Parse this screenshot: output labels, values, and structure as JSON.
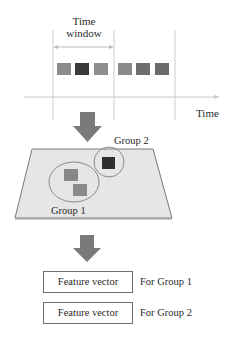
{
  "timeline": {
    "window_label_line1": "Time",
    "window_label_line2": "window",
    "axis_label": "Time",
    "squares": [
      {
        "color": "#8c8c8c"
      },
      {
        "color": "#3a3a3a"
      },
      {
        "color": "#8e8e8e"
      },
      {
        "color": "#8a8a8a"
      },
      {
        "color": "#6e6e6e"
      },
      {
        "color": "#6a6a6a"
      }
    ]
  },
  "grouping": {
    "group1_label": "Group 1",
    "group2_label": "Group 2",
    "plane_color": "#e6e6e6",
    "group1_square_color": "#888888",
    "group2_square_color": "#2e2e2e"
  },
  "features": {
    "rows": [
      {
        "box_label": "Feature vector",
        "for_label": "For Group 1"
      },
      {
        "box_label": "Feature vector",
        "for_label": "For Group 2"
      }
    ]
  },
  "colors": {
    "arrow": "#7a7a7a",
    "lines": "#c8c8c8"
  }
}
